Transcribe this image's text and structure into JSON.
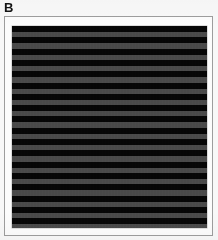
{
  "figure": {
    "panel_label": "B",
    "background_color": "#f8f8f8",
    "frame_color": "#9d9d9d",
    "mat_color": "#fcfcfc"
  },
  "stimulus": {
    "name": "square-wave-grating",
    "orientation": "horizontal",
    "dark_bar_color": "#060606",
    "light_bar_color": "#4a4a4a",
    "bar_count_dark": 18,
    "bar_count_light": 17,
    "period_px": 11.3,
    "duty_cycle": 0.5,
    "first_bar": "dark",
    "last_bar": "dark",
    "bars": [
      {
        "index": 0,
        "tone": "dark",
        "top": 0.0,
        "height": 6.0
      },
      {
        "index": 1,
        "tone": "light",
        "top": 6.0,
        "height": 5.3
      },
      {
        "index": 2,
        "tone": "dark",
        "top": 11.3,
        "height": 6.0
      },
      {
        "index": 3,
        "tone": "light",
        "top": 17.3,
        "height": 5.3
      },
      {
        "index": 4,
        "tone": "dark",
        "top": 22.6,
        "height": 6.0
      },
      {
        "index": 5,
        "tone": "light",
        "top": 28.6,
        "height": 5.3
      },
      {
        "index": 6,
        "tone": "dark",
        "top": 33.9,
        "height": 6.0
      },
      {
        "index": 7,
        "tone": "light",
        "top": 39.9,
        "height": 5.3
      },
      {
        "index": 8,
        "tone": "dark",
        "top": 45.2,
        "height": 6.0
      },
      {
        "index": 9,
        "tone": "light",
        "top": 51.2,
        "height": 5.3
      },
      {
        "index": 10,
        "tone": "dark",
        "top": 56.5,
        "height": 6.0
      },
      {
        "index": 11,
        "tone": "light",
        "top": 62.5,
        "height": 5.3
      },
      {
        "index": 12,
        "tone": "dark",
        "top": 67.8,
        "height": 6.0
      },
      {
        "index": 13,
        "tone": "light",
        "top": 73.8,
        "height": 5.3
      },
      {
        "index": 14,
        "tone": "dark",
        "top": 79.1,
        "height": 6.0
      },
      {
        "index": 15,
        "tone": "light",
        "top": 85.1,
        "height": 5.3
      },
      {
        "index": 16,
        "tone": "dark",
        "top": 90.4,
        "height": 6.0
      },
      {
        "index": 17,
        "tone": "light",
        "top": 96.4,
        "height": 5.3
      },
      {
        "index": 18,
        "tone": "dark",
        "top": 101.7,
        "height": 6.0
      },
      {
        "index": 19,
        "tone": "light",
        "top": 107.7,
        "height": 5.3
      },
      {
        "index": 20,
        "tone": "dark",
        "top": 113.0,
        "height": 6.0
      },
      {
        "index": 21,
        "tone": "light",
        "top": 119.0,
        "height": 5.3
      },
      {
        "index": 22,
        "tone": "dark",
        "top": 124.3,
        "height": 6.0
      },
      {
        "index": 23,
        "tone": "light",
        "top": 130.3,
        "height": 5.3
      },
      {
        "index": 24,
        "tone": "dark",
        "top": 135.6,
        "height": 6.0
      },
      {
        "index": 25,
        "tone": "light",
        "top": 141.6,
        "height": 5.3
      },
      {
        "index": 26,
        "tone": "dark",
        "top": 146.9,
        "height": 6.0
      },
      {
        "index": 27,
        "tone": "light",
        "top": 152.9,
        "height": 5.3
      },
      {
        "index": 28,
        "tone": "dark",
        "top": 158.2,
        "height": 6.0
      },
      {
        "index": 29,
        "tone": "light",
        "top": 164.2,
        "height": 5.3
      },
      {
        "index": 30,
        "tone": "dark",
        "top": 169.5,
        "height": 6.0
      },
      {
        "index": 31,
        "tone": "light",
        "top": 175.5,
        "height": 5.3
      },
      {
        "index": 32,
        "tone": "dark",
        "top": 180.8,
        "height": 6.0
      },
      {
        "index": 33,
        "tone": "light",
        "top": 186.8,
        "height": 5.3
      },
      {
        "index": 34,
        "tone": "dark",
        "top": 192.1,
        "height": 6.0
      },
      {
        "index": 35,
        "tone": "light",
        "top": 198.1,
        "height": 3.9
      }
    ]
  }
}
